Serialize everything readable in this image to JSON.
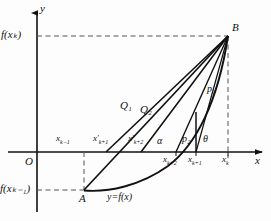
{
  "figure": {
    "kind": "math-diagram",
    "axes": {
      "x_axis_label": "x",
      "y_axis_label": "y",
      "origin_label": "O"
    },
    "axis_value_labels": {
      "y_top": "f(xₖ)",
      "y_bottom": "f(xₖ₋₁)"
    },
    "points": {
      "A": "A",
      "B": "B",
      "P1": "p₁",
      "P2": "p₂",
      "Q1": "Q₁",
      "Q2": "Q₂"
    },
    "angles": {
      "alpha": "α",
      "theta": "θ"
    },
    "curve_label": "y=f(x)",
    "upper_tick_labels": [
      {
        "id": "xk-1",
        "base": "x",
        "sub": "k−1",
        "prime": false
      },
      {
        "id": "xp-k+1",
        "base": "x",
        "sub": "k+1",
        "prime": true
      },
      {
        "id": "xp-k+2",
        "base": "x",
        "sub": "k+2",
        "prime": true
      }
    ],
    "lower_tick_labels": [
      {
        "id": "xk+2",
        "base": "x",
        "sub": "k+2",
        "prime": false
      },
      {
        "id": "xk+1",
        "base": "x",
        "sub": "k+1",
        "prime": false
      },
      {
        "id": "xk",
        "base": "x",
        "sub": "k",
        "prime": false
      }
    ],
    "colors": {
      "ink": "#111111",
      "dashed": "#555555",
      "background": "#fdfdfd"
    }
  }
}
